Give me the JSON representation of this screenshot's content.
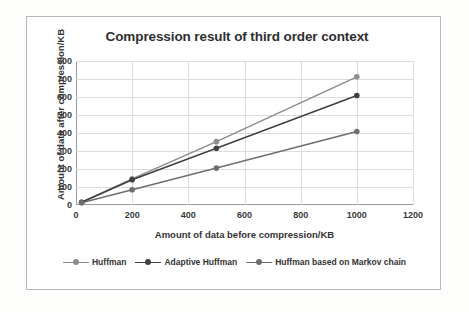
{
  "chart_data": {
    "type": "line",
    "title": "Compression result of third order context",
    "xlabel": "Amount of data before compression/KB",
    "ylabel": "Amount of data after compression/KB",
    "xlim": [
      0,
      1200
    ],
    "ylim": [
      0,
      800
    ],
    "xticks": [
      0,
      200,
      400,
      600,
      800,
      1000,
      1200
    ],
    "yticks": [
      0,
      100,
      200,
      300,
      400,
      500,
      600,
      700,
      800
    ],
    "grid": true,
    "legend_position": "bottom",
    "series": [
      {
        "name": "Huffman",
        "color": "#8c8c8c",
        "x": [
          20,
          200,
          500,
          1000
        ],
        "values": [
          15,
          145,
          352,
          712
        ]
      },
      {
        "name": "Adaptive Huffman",
        "color": "#404040",
        "x": [
          20,
          200,
          500,
          1000
        ],
        "values": [
          15,
          140,
          315,
          608
        ]
      },
      {
        "name": "Huffman based on Markov chain",
        "color": "#6e6e6e",
        "x": [
          20,
          200,
          500,
          1000
        ],
        "values": [
          12,
          85,
          205,
          408
        ]
      }
    ]
  }
}
